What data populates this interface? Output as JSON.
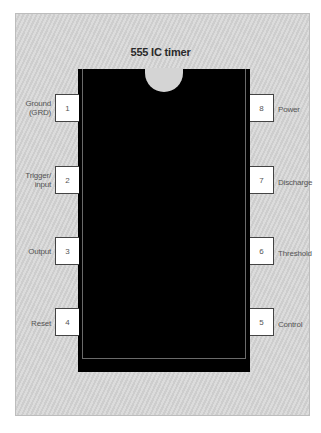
{
  "diagram": {
    "title": "555 IC timer",
    "chip": {
      "body_color": "#000000",
      "background_color": "#d4d4d4",
      "notch": "semicircle-top"
    },
    "pins": {
      "left": [
        {
          "number": "1",
          "label_line1": "Ground",
          "label_line2": "(GRD)"
        },
        {
          "number": "2",
          "label_line1": "Trigger/",
          "label_line2": "input"
        },
        {
          "number": "3",
          "label_line1": "Output",
          "label_line2": ""
        },
        {
          "number": "4",
          "label_line1": "Reset",
          "label_line2": ""
        }
      ],
      "right": [
        {
          "number": "8",
          "label_line1": "Power",
          "label_line2": ""
        },
        {
          "number": "7",
          "label_line1": "Discharge",
          "label_line2": ""
        },
        {
          "number": "6",
          "label_line1": "Threshold",
          "label_line2": ""
        },
        {
          "number": "5",
          "label_line1": "Control",
          "label_line2": ""
        }
      ]
    }
  }
}
